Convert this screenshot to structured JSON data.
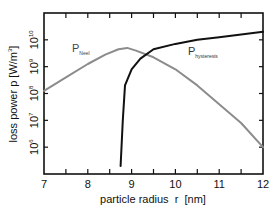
{
  "chart_data": {
    "type": "line",
    "title": "",
    "xlabel": "particle radius  r  [nm]",
    "ylabel": "loss power p [W/m³]",
    "ylabel_parts": {
      "main": "loss power p [W/m",
      "sup": "3",
      "end": "]"
    },
    "xlim": [
      7,
      12
    ],
    "ylim_log10": [
      5,
      11
    ],
    "yscale": "log",
    "grid": false,
    "legend": "inline labels",
    "x_ticks": [
      "7",
      "8",
      "9",
      "10",
      "11",
      "12"
    ],
    "y_ticks": [
      {
        "base": "10",
        "exp": "10",
        "log10": 10
      },
      {
        "base": "10",
        "exp": "9",
        "log10": 9
      },
      {
        "base": "10",
        "exp": "8",
        "log10": 8
      },
      {
        "base": "10",
        "exp": "7",
        "log10": 7
      },
      {
        "base": "10",
        "exp": "6",
        "log10": 6
      }
    ],
    "series": [
      {
        "name": "P_Neel",
        "label_main": "P",
        "label_sub": "Neel",
        "color": "#8c8c8c",
        "x": [
          7.0,
          7.5,
          8.0,
          8.4,
          8.7,
          8.9,
          9.1,
          9.5,
          10.0,
          10.5,
          11.0,
          11.5,
          12.0
        ],
        "log10_y": [
          8.1,
          8.6,
          9.1,
          9.45,
          9.65,
          9.7,
          9.6,
          9.35,
          8.9,
          8.3,
          7.6,
          6.9,
          6.0
        ]
      },
      {
        "name": "P_hysteresis",
        "label_main": "P",
        "label_sub": "hysteresis",
        "color": "#111111",
        "x": [
          8.75,
          8.8,
          8.85,
          9.0,
          9.2,
          9.5,
          10.0,
          10.5,
          11.0,
          11.5,
          12.0
        ],
        "log10_y": [
          5.3,
          7.0,
          8.3,
          8.9,
          9.3,
          9.65,
          9.85,
          10.0,
          10.1,
          10.2,
          10.3
        ]
      }
    ]
  }
}
